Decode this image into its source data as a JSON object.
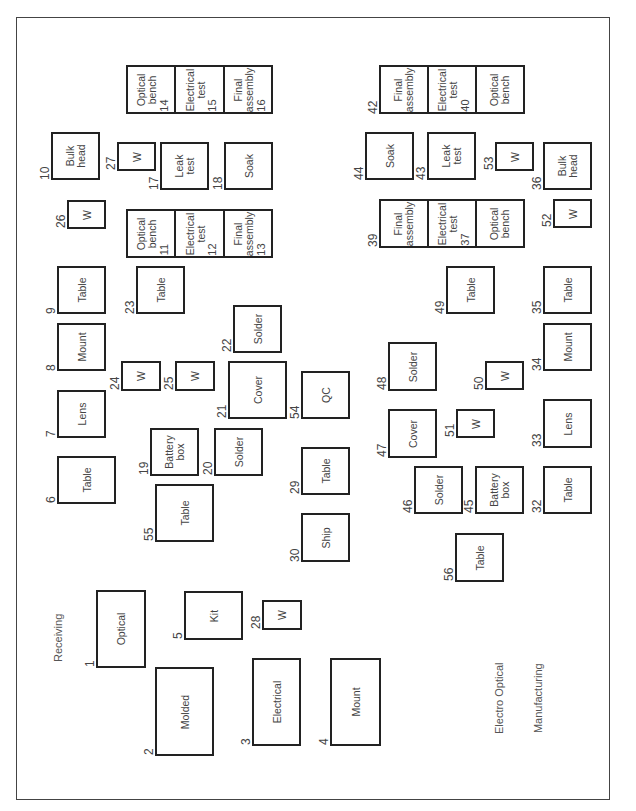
{
  "title": "Electro Optical Manufacturing",
  "title_line1": "Electro Optical",
  "title_line2": "Manufacturing",
  "receiving_label": "Receiving",
  "stations": {
    "s1": {
      "num": "1",
      "label": "Optical"
    },
    "s2": {
      "num": "2",
      "label": "Molded"
    },
    "s3": {
      "num": "3",
      "label": "Electrical"
    },
    "s4": {
      "num": "4",
      "label": "Mount"
    },
    "s5": {
      "num": "5",
      "label": "Kit"
    },
    "s6": {
      "num": "6",
      "label": "Table"
    },
    "s7": {
      "num": "7",
      "label": "Lens"
    },
    "s8": {
      "num": "8",
      "label": "Mount"
    },
    "s9": {
      "num": "9",
      "label": "Table"
    },
    "s10": {
      "num": "10",
      "label": "Bulk\nhead"
    },
    "s11": {
      "num": "11",
      "label": "Optical\nbench"
    },
    "s12": {
      "num": "12",
      "label": "Electrical\ntest"
    },
    "s13": {
      "num": "13",
      "label": "Final\nassembly"
    },
    "s14": {
      "num": "14",
      "label": "Optical\nbench"
    },
    "s15": {
      "num": "15",
      "label": "Electrical\ntest"
    },
    "s16": {
      "num": "16",
      "label": "Final\nassembly"
    },
    "s17": {
      "num": "17",
      "label": "Leak\ntest"
    },
    "s18": {
      "num": "18",
      "label": "Soak"
    },
    "s19": {
      "num": "19",
      "label": "Battery\nbox"
    },
    "s20": {
      "num": "20",
      "label": "Solder"
    },
    "s21": {
      "num": "21",
      "label": "Cover"
    },
    "s22": {
      "num": "22",
      "label": "Solder"
    },
    "s23": {
      "num": "23",
      "label": "Table"
    },
    "s24": {
      "num": "24",
      "label": "W"
    },
    "s25": {
      "num": "25",
      "label": "W"
    },
    "s26": {
      "num": "26",
      "label": "W"
    },
    "s27": {
      "num": "27",
      "label": "W"
    },
    "s28": {
      "num": "28",
      "label": "W"
    },
    "s29": {
      "num": "29",
      "label": "Table"
    },
    "s30": {
      "num": "30",
      "label": "Ship"
    },
    "s32": {
      "num": "32",
      "label": "Table"
    },
    "s33": {
      "num": "33",
      "label": "Lens"
    },
    "s34": {
      "num": "34",
      "label": "Mount"
    },
    "s35": {
      "num": "35",
      "label": "Table"
    },
    "s36": {
      "num": "36",
      "label": "Bulk\nhead"
    },
    "s37": {
      "num": "37",
      "label": "Electrical\ntest"
    },
    "s38": {
      "num": "",
      "label": "Optical\nbench"
    },
    "s39": {
      "num": "39",
      "label": "Final\nassembly"
    },
    "s40": {
      "num": "40",
      "label": "Electrical\ntest"
    },
    "s41": {
      "num": "",
      "label": "Optical\nbench"
    },
    "s42": {
      "num": "42",
      "label": "Final\nassembly"
    },
    "s43": {
      "num": "43",
      "label": "Leak\ntest"
    },
    "s44": {
      "num": "44",
      "label": "Soak"
    },
    "s45": {
      "num": "45",
      "label": "Battery\nbox"
    },
    "s46": {
      "num": "46",
      "label": "Solder"
    },
    "s47": {
      "num": "47",
      "label": "Cover"
    },
    "s48": {
      "num": "48",
      "label": "Solder"
    },
    "s49": {
      "num": "49",
      "label": "Table"
    },
    "s50": {
      "num": "50",
      "label": "W"
    },
    "s51": {
      "num": "51",
      "label": "W"
    },
    "s52": {
      "num": "52",
      "label": "W"
    },
    "s53": {
      "num": "53",
      "label": "W"
    },
    "s54": {
      "num": "54",
      "label": "QC"
    },
    "s55": {
      "num": "55",
      "label": "Table"
    },
    "s56": {
      "num": "56",
      "label": "Table"
    }
  }
}
